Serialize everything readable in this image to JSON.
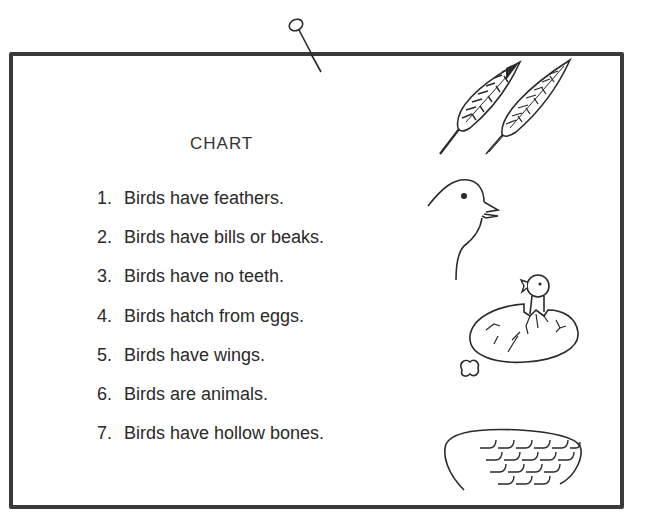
{
  "chart": {
    "title": "CHART",
    "facts": [
      {
        "number": "1.",
        "text": "Birds have feathers."
      },
      {
        "number": "2.",
        "text": "Birds have bills or beaks."
      },
      {
        "number": "3.",
        "text": "Birds have no teeth."
      },
      {
        "number": "4.",
        "text": "Birds hatch from eggs."
      },
      {
        "number": "5.",
        "text": "Birds have wings."
      },
      {
        "number": "6.",
        "text": "Birds are animals."
      },
      {
        "number": "7.",
        "text": "Birds have hollow bones."
      }
    ]
  },
  "illustrations": [
    {
      "name": "feathers",
      "depicts": "two feathers"
    },
    {
      "name": "bird-head",
      "depicts": "bird head with open beak"
    },
    {
      "name": "hatching-egg",
      "depicts": "chick hatching from egg"
    },
    {
      "name": "wing",
      "depicts": "bird wing"
    }
  ],
  "colors": {
    "ink": "#2a2a2a",
    "frame": "#3a3a3a",
    "background": "#ffffff"
  }
}
